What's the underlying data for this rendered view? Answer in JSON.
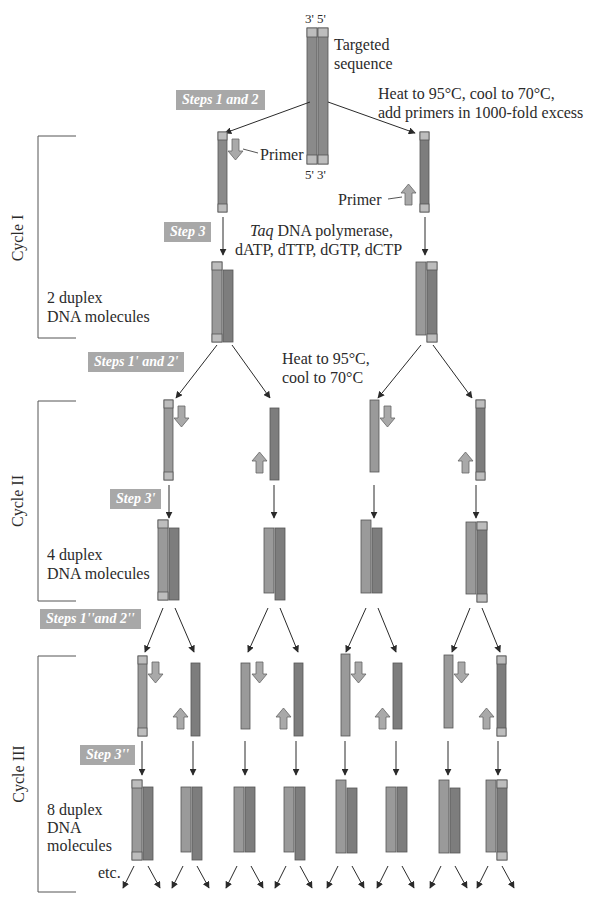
{
  "top": {
    "strand_end_top": "3' 5'",
    "strand_end_bottom": "5' 3'",
    "targeted_line1": "Targeted",
    "targeted_line2": "sequence",
    "heat_line1": "Heat to 95°C, cool to 70°C,",
    "heat_line2": "add primers in 1000-fold excess"
  },
  "steps": {
    "step1_2": "Steps 1 and 2",
    "step3": "Step 3",
    "step1p_2p": "Steps 1' and 2'",
    "step3p": "Step 3'",
    "step1pp_2pp": "Steps 1''and 2''",
    "step3pp": "Step 3''"
  },
  "labels": {
    "primer_left": "Primer",
    "primer_right": "Primer",
    "taq_italic": "Taq",
    "taq_rest": " DNA polymerase,",
    "dntps": "dATP, dTTP, dGTP, dCTP",
    "cycle1_result_line1": "2 duplex",
    "cycle1_result_line2": "DNA molecules",
    "heat2_line1": "Heat to 95°C,",
    "heat2_line2": "cool to 70°C",
    "cycle2_result_line1": "4 duplex",
    "cycle2_result_line2": "DNA molecules",
    "cycle3_result_line1": "8 duplex",
    "cycle3_result_line2": "DNA",
    "cycle3_result_line3": "molecules",
    "etc": "etc."
  },
  "cycles": [
    "Cycle I",
    "Cycle II",
    "Cycle III"
  ],
  "colors": {
    "strand_dark": "#7d7d7d",
    "strand_medium": "#9a9a9a",
    "strand_end_cap": "#bdbdbd",
    "primer_fill": "#a9a9a9",
    "step_badge": "#a8a8a8",
    "line": "#2a2a2a"
  }
}
